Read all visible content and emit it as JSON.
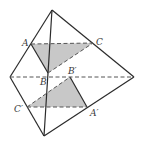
{
  "figure": {
    "colors": {
      "stroke": "#2b2b2b",
      "shade": "#c8c8c8",
      "background": "#ffffff"
    },
    "vertices": {
      "top": [
        52,
        10
      ],
      "left": [
        10,
        77
      ],
      "right": [
        134,
        77
      ],
      "bottom": [
        44,
        136
      ]
    },
    "points": {
      "A": {
        "label": "A",
        "xy": [
          31,
          44
        ],
        "label_xy": [
          22,
          46
        ]
      },
      "C": {
        "label": "C",
        "xy": [
          93,
          43
        ],
        "label_xy": [
          96,
          45
        ]
      },
      "B": {
        "label": "B",
        "xy": [
          48,
          73
        ],
        "label_xy": [
          40,
          85
        ]
      },
      "B'": {
        "label": "B′",
        "xy": [
          70,
          77
        ],
        "label_xy": [
          68,
          74
        ]
      },
      "C'": {
        "label": "C′",
        "xy": [
          27,
          107
        ],
        "label_xy": [
          14,
          112
        ]
      },
      "A'": {
        "label": "A′",
        "xy": [
          87,
          107
        ],
        "label_xy": [
          90,
          116
        ]
      }
    }
  }
}
